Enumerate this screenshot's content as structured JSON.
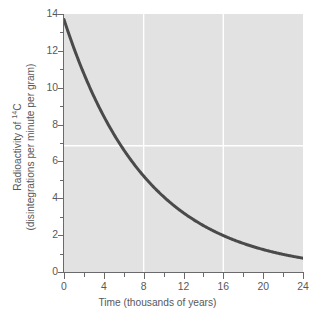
{
  "chart_data": {
    "type": "line",
    "title": "",
    "subtitle": "",
    "xlabel": "Time (thousands of years)",
    "ylabel_line1": "Radioactivity of 14C",
    "ylabel_line1_prefix": "Radioactivity of ",
    "ylabel_line1_sup": "14",
    "ylabel_line1_suffix": "C",
    "ylabel_line2": "(disintegrations per minute per gram)",
    "xlim": [
      0,
      24
    ],
    "ylim": [
      0,
      14
    ],
    "x_major_ticks": [
      0,
      4,
      8,
      12,
      16,
      20,
      24
    ],
    "x_minor_ticks": [
      2,
      6,
      10,
      14,
      18,
      22
    ],
    "x_tick_labels": [
      "0",
      "4",
      "8",
      "12",
      "16",
      "20",
      "24"
    ],
    "y_major_ticks": [
      0,
      2,
      4,
      6,
      8,
      10,
      12,
      14
    ],
    "y_minor_ticks": [
      1,
      3,
      5,
      7,
      9,
      11,
      13
    ],
    "y_tick_labels": [
      "0",
      "2",
      "4",
      "6",
      "8",
      "10",
      "12",
      "14"
    ],
    "grid": {
      "enabled": true,
      "color": "#ffffff",
      "vertical_at_x": [
        8,
        16
      ],
      "horizontal_at_y": [
        6.85
      ]
    },
    "legend": {
      "visible": false,
      "position": "none"
    },
    "series": [
      {
        "name": "Radioactivity of 14C",
        "color": "#4a4a4a",
        "line_width": 3,
        "initial_value": 13.7,
        "half_life": 5.73,
        "x": [
          0,
          1,
          2,
          3,
          4,
          5,
          5.73,
          6,
          7,
          8,
          9,
          10,
          11,
          12,
          13,
          14,
          15,
          16,
          17,
          18,
          19,
          20,
          21,
          22,
          23,
          24
        ],
        "values": [
          13.7,
          12.14,
          10.76,
          9.54,
          8.45,
          7.49,
          6.85,
          6.64,
          5.88,
          5.21,
          4.62,
          4.09,
          3.63,
          3.21,
          2.85,
          2.52,
          2.24,
          1.98,
          1.76,
          1.56,
          1.38,
          1.22,
          1.08,
          0.96,
          0.85,
          0.75
        ]
      }
    ],
    "colors": {
      "plot_background": "#e2e2e2",
      "page_background": "#ffffff",
      "curve": "#4a4a4a",
      "axis": "#6a6a6c",
      "text": "#58585a",
      "gridline": "#ffffff"
    }
  }
}
